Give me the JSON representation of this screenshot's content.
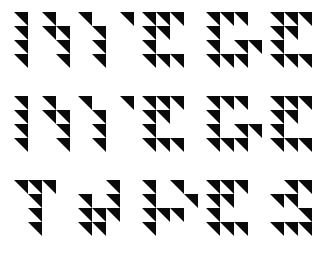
{
  "canvas": {
    "width": 333,
    "height": 258,
    "background_color": "#ffffff",
    "ink_color": "#0a0a0a"
  },
  "layout": {
    "rows": 3,
    "columns": 5,
    "glyph_grid_rows": 4,
    "glyph_grid_columns": 4,
    "cell_size_px": 14,
    "glyph_gap_x_px": 8,
    "glyph_gap_y_px": 28,
    "origin_x_px": 14,
    "origin_y_px": 12
  },
  "legend": {
    "empty": "0",
    "top_left": "tl",
    "top_right": "tr",
    "bottom_left": "bl",
    "bottom_right": "br",
    "description": "Each glyph is a 4x4 grid of cells; each cell is empty or holds a right triangle whose right-angle corner is named by the code."
  },
  "glyph_rows": [
    {
      "row_label": "row-1",
      "glyphs": [
        {
          "name": "glyph-r1c1",
          "reading": "N",
          "matrix": [
            [
              "tr",
              "0",
              "tr",
              "0"
            ],
            [
              "tr",
              "0",
              "tr",
              "tr"
            ],
            [
              "tr",
              "0",
              "0",
              "tr"
            ],
            [
              "tr",
              "0",
              "0",
              "tr"
            ]
          ]
        },
        {
          "name": "glyph-r1c2",
          "reading": "Y",
          "matrix": [
            [
              "tr",
              "0",
              "0",
              "tr"
            ],
            [
              "0",
              "tr",
              "0",
              "0"
            ],
            [
              "0",
              "tr",
              "0",
              "0"
            ],
            [
              "0",
              "tr",
              "0",
              "0"
            ]
          ]
        },
        {
          "name": "glyph-r1c3",
          "reading": "E",
          "matrix": [
            [
              "tr",
              "tr",
              "tr",
              "0"
            ],
            [
              "tr",
              "tr",
              "0",
              "0"
            ],
            [
              "tr",
              "0",
              "0",
              "0"
            ],
            [
              "tr",
              "tr",
              "tr",
              "0"
            ]
          ]
        },
        {
          "name": "glyph-r1c4",
          "reading": "G",
          "matrix": [
            [
              "tr",
              "tr",
              "tr",
              "0"
            ],
            [
              "tr",
              "0",
              "0",
              "0"
            ],
            [
              "tr",
              "0",
              "tr",
              "tr"
            ],
            [
              "tr",
              "tr",
              "tr",
              "0"
            ]
          ]
        },
        {
          "name": "glyph-r1c5",
          "reading": "E",
          "matrix": [
            [
              "tr",
              "tr",
              "tr",
              "0"
            ],
            [
              "tr",
              "tr",
              "0",
              "0"
            ],
            [
              "tr",
              "0",
              "0",
              "0"
            ],
            [
              "tr",
              "tr",
              "tr",
              "0"
            ]
          ]
        }
      ]
    },
    {
      "row_label": "row-2",
      "glyphs": [
        {
          "name": "glyph-r2c1",
          "reading": "N",
          "matrix": [
            [
              "tr",
              "0",
              "tr",
              "0"
            ],
            [
              "tr",
              "0",
              "tr",
              "tr"
            ],
            [
              "tr",
              "0",
              "0",
              "tr"
            ],
            [
              "tr",
              "0",
              "0",
              "tr"
            ]
          ]
        },
        {
          "name": "glyph-r2c2",
          "reading": "Y",
          "matrix": [
            [
              "tr",
              "0",
              "0",
              "tr"
            ],
            [
              "0",
              "tr",
              "0",
              "0"
            ],
            [
              "0",
              "tr",
              "0",
              "0"
            ],
            [
              "0",
              "tr",
              "0",
              "0"
            ]
          ]
        },
        {
          "name": "glyph-r2c3",
          "reading": "E",
          "matrix": [
            [
              "tr",
              "tr",
              "tr",
              "0"
            ],
            [
              "tr",
              "tr",
              "0",
              "0"
            ],
            [
              "tr",
              "0",
              "0",
              "0"
            ],
            [
              "tr",
              "tr",
              "tr",
              "0"
            ]
          ]
        },
        {
          "name": "glyph-r2c4",
          "reading": "G",
          "matrix": [
            [
              "tr",
              "tr",
              "tr",
              "0"
            ],
            [
              "tr",
              "0",
              "0",
              "0"
            ],
            [
              "tr",
              "0",
              "tr",
              "tr"
            ],
            [
              "tr",
              "tr",
              "tr",
              "0"
            ]
          ]
        },
        {
          "name": "glyph-r2c5",
          "reading": "E",
          "matrix": [
            [
              "tr",
              "tr",
              "tr",
              "0"
            ],
            [
              "tr",
              "tr",
              "0",
              "0"
            ],
            [
              "tr",
              "0",
              "0",
              "0"
            ],
            [
              "tr",
              "tr",
              "tr",
              "0"
            ]
          ]
        }
      ]
    },
    {
      "row_label": "row-3",
      "glyphs": [
        {
          "name": "glyph-r3c1",
          "reading": "Y",
          "matrix": [
            [
              "tr",
              "tr",
              "tr",
              "0"
            ],
            [
              "0",
              "tr",
              "0",
              "0"
            ],
            [
              "0",
              "tr",
              "0",
              "0"
            ],
            [
              "0",
              "tr",
              "0",
              "0"
            ]
          ]
        },
        {
          "name": "glyph-r3c2",
          "reading": "A",
          "matrix": [
            [
              "0",
              "0",
              "tr",
              "0"
            ],
            [
              "tr",
              "0",
              "tr",
              "0"
            ],
            [
              "tr",
              "tr",
              "tr",
              "0"
            ],
            [
              "tr",
              "tr",
              "0",
              "0"
            ]
          ]
        },
        {
          "name": "glyph-r3c3",
          "reading": "P",
          "matrix": [
            [
              "tr",
              "0",
              "tr",
              "0"
            ],
            [
              "tr",
              "0",
              "0",
              "tr"
            ],
            [
              "tr",
              "tr",
              "tr",
              "0"
            ],
            [
              "tr",
              "0",
              "0",
              "0"
            ]
          ]
        },
        {
          "name": "glyph-r3c4",
          "reading": "E",
          "matrix": [
            [
              "tr",
              "tr",
              "tr",
              "0"
            ],
            [
              "tr",
              "tr",
              "0",
              "0"
            ],
            [
              "tr",
              "0",
              "0",
              "0"
            ],
            [
              "tr",
              "tr",
              "tr",
              "0"
            ]
          ]
        },
        {
          "name": "glyph-r3c5",
          "reading": "S",
          "matrix": [
            [
              "0",
              "tr",
              "tr",
              "0"
            ],
            [
              "tr",
              "tr",
              "0",
              "0"
            ],
            [
              "0",
              "0",
              "tr",
              "0"
            ],
            [
              "tr",
              "tr",
              "tr",
              "0"
            ]
          ]
        }
      ]
    }
  ]
}
